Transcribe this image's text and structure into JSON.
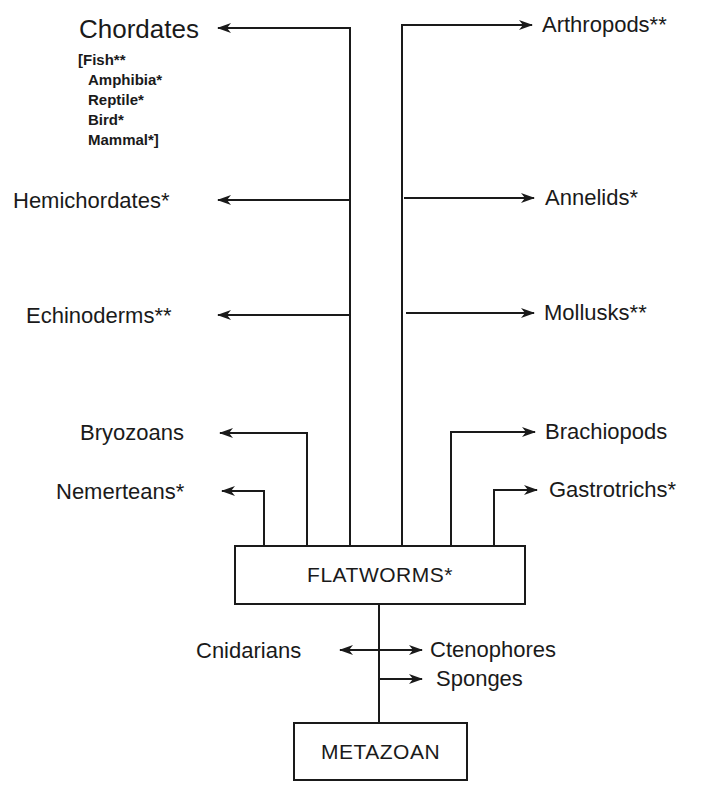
{
  "diagram": {
    "type": "phylogenetic tree",
    "root": "METAZOAN",
    "hub": "FLATWORMS*",
    "left_branches": [
      {
        "label": "Chordates",
        "sublist": [
          "[Fish**",
          "Amphibia*",
          "Reptile*",
          "Bird*",
          "Mammal*]"
        ]
      },
      {
        "label": "Hemichordates*"
      },
      {
        "label": "Echinoderms**"
      },
      {
        "label": "Bryozoans"
      },
      {
        "label": "Nemerteans*"
      }
    ],
    "right_branches": [
      {
        "label": "Arthropods**"
      },
      {
        "label": "Annelids*"
      },
      {
        "label": "Mollusks**"
      },
      {
        "label": "Brachiopods"
      },
      {
        "label": "Gastrotrichs*"
      }
    ],
    "base_branches": [
      {
        "label": "Cnidarians"
      },
      {
        "label": "Ctenophores"
      },
      {
        "label": "Sponges"
      }
    ]
  }
}
